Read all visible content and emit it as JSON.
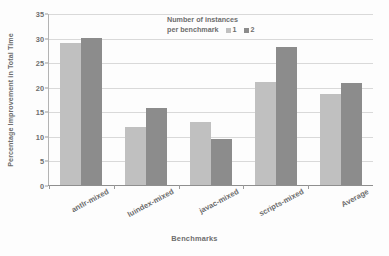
{
  "chart_data": {
    "type": "bar",
    "title": "",
    "xlabel": "Benchmarks",
    "ylabel": "Percentage Improvement in Total Time",
    "categories": [
      "antlr-mixed",
      "luindex-mixed",
      "javac-mixed",
      "scripts-mixed",
      "Average"
    ],
    "series": [
      {
        "name": "1",
        "color": "#c0c0c0",
        "values": [
          29.0,
          11.8,
          12.8,
          20.9,
          18.6
        ]
      },
      {
        "name": "2",
        "color": "#8c8c8c",
        "values": [
          29.9,
          15.6,
          9.4,
          28.1,
          20.7
        ]
      }
    ],
    "ylim": [
      0,
      35
    ],
    "yticks": [
      0,
      5,
      10,
      15,
      20,
      25,
      30,
      35
    ],
    "ytick_labels": [
      "0",
      "5",
      "10",
      "15",
      "20",
      "25",
      "30",
      "35"
    ],
    "grid": true,
    "legend": {
      "position": "top-center-inside",
      "title_line_1": "Number of instances",
      "title_line_2": "per benchmark",
      "entries": [
        {
          "label": "1",
          "color": "#c0c0c0"
        },
        {
          "label": "2",
          "color": "#8c8c8c"
        }
      ]
    }
  }
}
